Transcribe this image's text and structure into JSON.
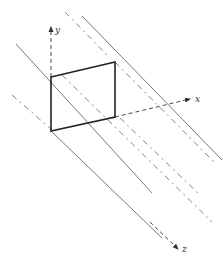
{
  "diagram": {
    "axes": {
      "x": {
        "label": "x"
      },
      "y": {
        "label": "y"
      },
      "z": {
        "label": "z"
      }
    },
    "colors": {
      "stroke": "#333333",
      "rect_stroke": "#222222",
      "background": "#ffffff"
    }
  }
}
